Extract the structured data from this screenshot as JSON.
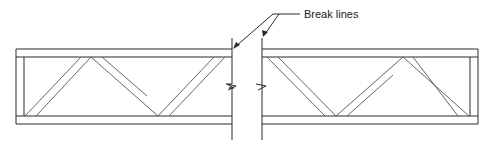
{
  "diagram": {
    "callout": {
      "label": "Break lines",
      "label_pos": [
        304,
        18
      ],
      "leader_elbow": [
        273,
        14
      ],
      "leader_end": [
        300,
        14
      ],
      "arrow_targets": [
        [
          233,
          48
        ],
        [
          263,
          50
        ]
      ]
    },
    "colors": {
      "line": "#2a2a2a",
      "background": "#ffffff"
    },
    "chords": {
      "top_outer_y": 49,
      "top_inner_y": 57,
      "bottom_inner_y": 116,
      "bottom_outer_y": 124
    },
    "left_segment": {
      "x_start": 16,
      "x_end": 232,
      "end_post_inner_x": 24
    },
    "right_segment": {
      "x_start": 262,
      "x_end": 478,
      "end_post_inner_x": 470
    },
    "break_lines": [
      {
        "x": 232,
        "y_top": 38,
        "y_bottom": 140,
        "zigzag_y": 86
      },
      {
        "x": 262,
        "y_top": 38,
        "y_bottom": 140,
        "zigzag_y": 86
      }
    ],
    "web_members": [
      {
        "segment": "left",
        "from": [
          26,
          116
        ],
        "to": [
          91,
          57
        ]
      },
      {
        "segment": "left",
        "from": [
          91,
          57
        ],
        "to": [
          158,
          116
        ]
      },
      {
        "segment": "left",
        "from": [
          158,
          116
        ],
        "to": [
          224,
          57
        ]
      },
      {
        "segment": "right",
        "from": [
          268,
          57
        ],
        "to": [
          336,
          116
        ]
      },
      {
        "segment": "right",
        "from": [
          336,
          116
        ],
        "to": [
          403,
          57
        ]
      },
      {
        "segment": "right",
        "from": [
          403,
          57
        ],
        "to": [
          469,
          116
        ]
      }
    ]
  }
}
